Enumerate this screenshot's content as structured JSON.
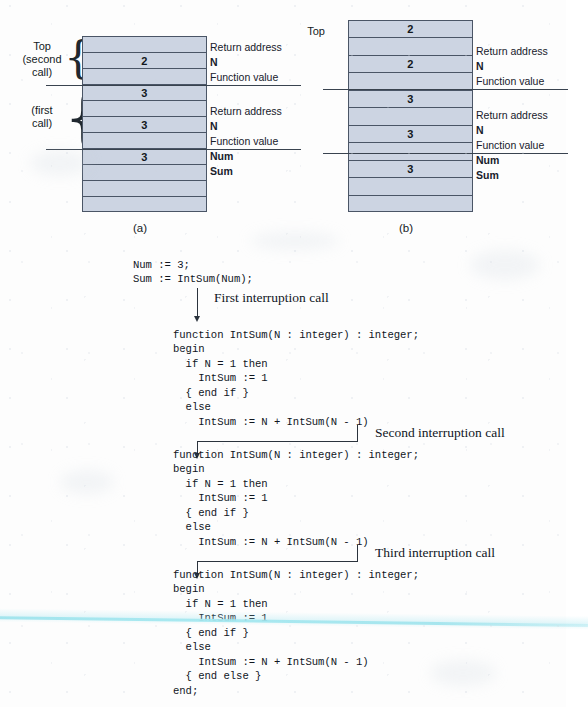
{
  "figure": {
    "panel_a": {
      "caption": "(a)",
      "top_label": "Top\n(second\ncall)",
      "first_call_label": "(first\ncall)",
      "cells": [
        "",
        "2",
        "",
        "3",
        "",
        "3",
        "",
        "3",
        "",
        "",
        ""
      ],
      "side_labels": [
        {
          "text": "Return address",
          "bold": false
        },
        {
          "text": "N",
          "bold": true
        },
        {
          "text": "Function value",
          "bold": false
        },
        {
          "text": "Return address",
          "bold": false
        },
        {
          "text": "N",
          "bold": true
        },
        {
          "text": "Function value",
          "bold": false
        },
        {
          "text": "Num",
          "bold": true
        },
        {
          "text": "Sum",
          "bold": true
        }
      ]
    },
    "panel_b": {
      "caption": "(b)",
      "top_label": "Top",
      "cells": [
        "2",
        "",
        "2",
        "",
        "3",
        "",
        "3",
        "",
        "3",
        "",
        ""
      ],
      "side_labels": [
        {
          "text": "Return address",
          "bold": false
        },
        {
          "text": "N",
          "bold": true
        },
        {
          "text": "Function value",
          "bold": false
        },
        {
          "text": "Return address",
          "bold": false
        },
        {
          "text": "N",
          "bold": true
        },
        {
          "text": "Function value",
          "bold": false
        },
        {
          "text": "Num",
          "bold": true
        },
        {
          "text": "Sum",
          "bold": true
        }
      ]
    }
  },
  "code": {
    "driver": "Num := 3;\nSum := IntSum(Num);",
    "block1": "function IntSum(N : integer) : integer;\nbegin\n  if N = 1 then\n    IntSum := 1\n  { end if }\n  else\n    IntSum := N + IntSum(N - 1)",
    "block2": "function IntSum(N : integer) : integer;\nbegin\n  if N = 1 then\n    IntSum := 1\n  { end if }\n  else\n    IntSum := N + IntSum(N - 1)",
    "block3": "function IntSum(N : integer) : integer;\nbegin\n  if N = 1 then\n    IntSum := 1\n  { end if }\n  else\n    IntSum := N + IntSum(N - 1)\n  { end else }\nend;"
  },
  "flow": {
    "first": "First interruption call",
    "second": "Second interruption call",
    "third": "Third interruption call"
  },
  "colors": {
    "stack_fill": "#ccd4e2",
    "stack_border": "#4a5566",
    "ink": "#10161e",
    "scan_artifact": "#96e1eb"
  }
}
